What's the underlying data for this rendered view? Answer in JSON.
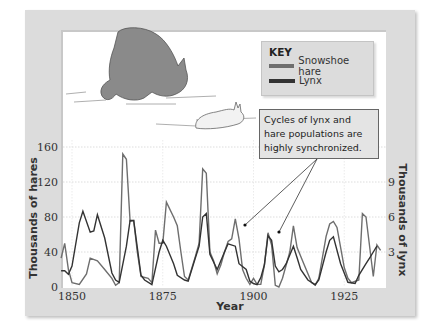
{
  "chart_data": {
    "type": "line",
    "title": "",
    "xlabel": "Year",
    "ylabel": "Thousands of hares",
    "ylabel_right": "Thousands of lynx",
    "xlim": [
      1847,
      1936
    ],
    "ylim": [
      0,
      160
    ],
    "ylim_right": [
      0,
      12
    ],
    "xticks": [
      "1850",
      "1875",
      "1900",
      "1925"
    ],
    "yticks": [
      "0",
      "40",
      "80",
      "120",
      "160"
    ],
    "yticks_right": [
      "3",
      "6",
      "9"
    ],
    "grid": true,
    "legend": {
      "title": "KEY",
      "position": "top-right",
      "entries": [
        "Snowshoe hare",
        "Lynx"
      ]
    },
    "annotations": [
      "Cycles of lynx and hare populations are highly synchronized."
    ],
    "series": [
      {
        "name": "Snowshoe hare",
        "color": "#6e6e6e",
        "x": [
          1847,
          1848,
          1849,
          1850,
          1852,
          1854,
          1855,
          1857,
          1859,
          1861,
          1862,
          1863,
          1864,
          1865,
          1866,
          1867,
          1868,
          1869,
          1871,
          1872,
          1873,
          1874,
          1875,
          1876,
          1878,
          1879,
          1880,
          1881,
          1882,
          1884,
          1885,
          1886,
          1887,
          1888,
          1889,
          1890,
          1891,
          1892,
          1893,
          1894,
          1895,
          1896,
          1897,
          1898,
          1899,
          1900,
          1901,
          1902,
          1903,
          1904,
          1905,
          1906,
          1907,
          1908,
          1910,
          1911,
          1912,
          1914,
          1916,
          1917,
          1918,
          1920,
          1921,
          1922,
          1923,
          1925,
          1926,
          1927,
          1929,
          1930,
          1931,
          1933,
          1934,
          1935
        ],
        "values": [
          33,
          50,
          20,
          5,
          3,
          15,
          33,
          30,
          20,
          10,
          2,
          5,
          152,
          146,
          75,
          76,
          40,
          12,
          10,
          5,
          65,
          50,
          50,
          97,
          80,
          70,
          40,
          12,
          8,
          35,
          50,
          135,
          130,
          40,
          30,
          15,
          25,
          40,
          52,
          55,
          78,
          55,
          20,
          10,
          3,
          10,
          3,
          3,
          25,
          62,
          48,
          2,
          0,
          10,
          40,
          70,
          45,
          25,
          5,
          2,
          10,
          58,
          72,
          75,
          68,
          22,
          10,
          5,
          8,
          84,
          80,
          12,
          48,
          42
        ]
      },
      {
        "name": "Lynx",
        "color": "#333333",
        "x": [
          1847,
          1848,
          1849,
          1850,
          1852,
          1853,
          1855,
          1856,
          1857,
          1859,
          1861,
          1862,
          1863,
          1865,
          1866,
          1867,
          1869,
          1870,
          1872,
          1874,
          1875,
          1876,
          1878,
          1879,
          1881,
          1882,
          1884,
          1885,
          1886,
          1887,
          1888,
          1890,
          1892,
          1893,
          1895,
          1896,
          1898,
          1899,
          1900,
          1901,
          1902,
          1903,
          1904,
          1905,
          1906,
          1907,
          1908,
          1909,
          1911,
          1912,
          1913,
          1915,
          1917,
          1918,
          1920,
          1921,
          1922,
          1924,
          1926,
          1928,
          1929,
          1931,
          1932,
          1933,
          1934
        ],
        "values": [
          1.4,
          1.4,
          1.1,
          1.8,
          5.5,
          6.5,
          4.7,
          4.8,
          6.2,
          4.2,
          1.2,
          0.6,
          0.4,
          3.5,
          5.7,
          5.7,
          1.0,
          0.6,
          0.2,
          3.0,
          4.0,
          3.5,
          2.0,
          1.0,
          0.6,
          0.5,
          2.5,
          3.5,
          6.0,
          6.3,
          2.8,
          1.5,
          3.0,
          3.7,
          3.5,
          2.0,
          1.5,
          0.5,
          0.3,
          0.2,
          0.8,
          1.9,
          4.4,
          4.0,
          1.8,
          1.3,
          1.5,
          2.0,
          3.5,
          2.5,
          1.5,
          0.6,
          0.2,
          0.6,
          3.0,
          4.0,
          4.3,
          2.0,
          0.4,
          0.3,
          1.0,
          2.0,
          2.5,
          3.0,
          3.5
        ]
      }
    ]
  },
  "key": {
    "title": "KEY",
    "items": [
      {
        "label": "Snowshoe hare",
        "color": "#6e6e6e"
      },
      {
        "label": "Lynx",
        "color": "#333333"
      }
    ]
  },
  "note": {
    "text": "Cycles of lynx and hare populations are highly synchronized."
  },
  "axes": {
    "x_title": "Year",
    "y_left_title": "Thousands of hares",
    "y_right_title": "Thousands of lynx",
    "x_ticks": [
      {
        "label": "1850",
        "year": 1850
      },
      {
        "label": "1875",
        "year": 1875
      },
      {
        "label": "1900",
        "year": 1900
      },
      {
        "label": "1925",
        "year": 1925
      }
    ],
    "y_left_ticks": [
      {
        "label": "0",
        "v": 0
      },
      {
        "label": "40",
        "v": 40
      },
      {
        "label": "80",
        "v": 80
      },
      {
        "label": "120",
        "v": 120
      },
      {
        "label": "160",
        "v": 160
      }
    ],
    "y_right_ticks": [
      {
        "label": "3",
        "v": 3
      },
      {
        "label": "6",
        "v": 6
      },
      {
        "label": "9",
        "v": 9
      }
    ]
  }
}
